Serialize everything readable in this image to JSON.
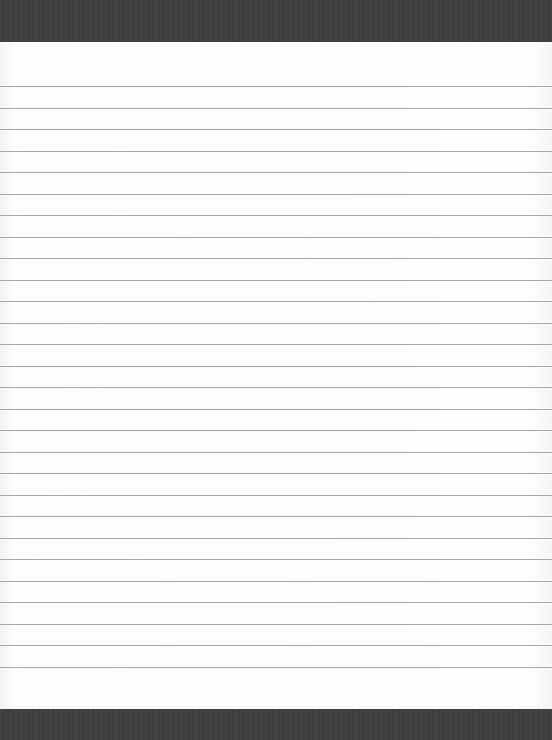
{
  "page": {
    "kind": "lined-notepad",
    "colors": {
      "band": "#3f3f3f",
      "paper": "#fdfdfd",
      "rule": "#a8a8a8"
    },
    "rules": {
      "count": 28,
      "first_y": 86,
      "spacing": 21.5
    }
  }
}
